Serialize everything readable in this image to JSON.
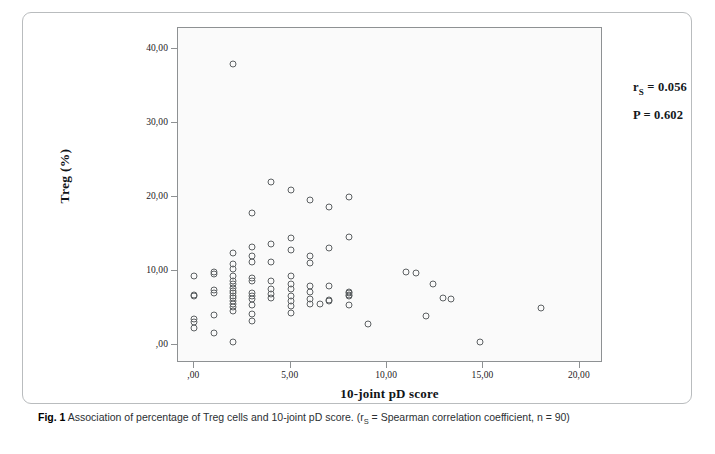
{
  "figure": {
    "caption_bold": "Fig. 1",
    "caption_text": " Association of percentage of Treg cells and 10-joint pD score. (r",
    "caption_sub": "S",
    "caption_tail": " = Spearman correlation coefficient, n = 90)"
  },
  "annotations": {
    "rs_prefix": "r",
    "rs_sub": "S",
    "rs_value": " = 0.056",
    "p_text": "P = 0.602"
  },
  "chart_data": {
    "type": "scatter",
    "title": "",
    "xlabel": "10-joint pD score",
    "ylabel": "Treg (%)",
    "xlim": [
      -0.85,
      21.2
    ],
    "ylim": [
      -2.4,
      42.8
    ],
    "xticks": [
      0,
      5,
      10,
      15,
      20
    ],
    "xticklabels": [
      ",00",
      "5,00",
      "10,00",
      "15,00",
      "20,00"
    ],
    "yticks": [
      0,
      10,
      20,
      30,
      40
    ],
    "yticklabels": [
      ",00",
      "10,00",
      "20,00",
      "30,00",
      "40,00"
    ],
    "grid": false,
    "legend": null,
    "marker": "open-circle",
    "marker_color": "#5d6163",
    "n_points": 90,
    "stats": {
      "spearman_rs": 0.056,
      "p_value": 0.602,
      "n": 90
    },
    "points": [
      [
        0.0,
        9.3
      ],
      [
        0.0,
        6.8
      ],
      [
        0.0,
        6.6
      ],
      [
        0.0,
        3.6
      ],
      [
        0.0,
        3.1
      ],
      [
        0.0,
        2.3
      ],
      [
        1.0,
        9.9
      ],
      [
        1.0,
        9.6
      ],
      [
        1.0,
        7.4
      ],
      [
        1.0,
        7.0
      ],
      [
        1.0,
        4.1
      ],
      [
        1.0,
        1.6
      ],
      [
        2.0,
        38.0
      ],
      [
        2.0,
        12.4
      ],
      [
        2.0,
        11.0
      ],
      [
        2.0,
        10.3
      ],
      [
        2.0,
        9.4
      ],
      [
        2.0,
        8.6
      ],
      [
        2.0,
        8.2
      ],
      [
        2.0,
        7.7
      ],
      [
        2.0,
        7.3
      ],
      [
        2.0,
        7.0
      ],
      [
        2.0,
        6.7
      ],
      [
        2.0,
        6.4
      ],
      [
        2.0,
        6.0
      ],
      [
        2.0,
        5.6
      ],
      [
        2.0,
        5.2
      ],
      [
        2.0,
        4.6
      ],
      [
        2.0,
        0.4
      ],
      [
        3.0,
        17.8
      ],
      [
        3.0,
        13.2
      ],
      [
        3.0,
        12.0
      ],
      [
        3.0,
        11.2
      ],
      [
        3.0,
        9.1
      ],
      [
        3.0,
        8.6
      ],
      [
        3.0,
        7.0
      ],
      [
        3.0,
        6.6
      ],
      [
        3.0,
        6.2
      ],
      [
        3.0,
        5.4
      ],
      [
        3.0,
        4.2
      ],
      [
        3.0,
        3.2
      ],
      [
        4.0,
        22.0
      ],
      [
        4.0,
        13.6
      ],
      [
        4.0,
        11.2
      ],
      [
        4.0,
        8.6
      ],
      [
        4.0,
        7.6
      ],
      [
        4.0,
        6.9
      ],
      [
        4.0,
        6.4
      ],
      [
        5.0,
        21.0
      ],
      [
        5.0,
        14.4
      ],
      [
        5.0,
        12.9
      ],
      [
        5.0,
        9.3
      ],
      [
        5.0,
        8.3
      ],
      [
        5.0,
        7.6
      ],
      [
        5.0,
        6.6
      ],
      [
        5.0,
        5.9
      ],
      [
        5.0,
        5.3
      ],
      [
        5.0,
        4.4
      ],
      [
        6.0,
        19.6
      ],
      [
        6.0,
        12.0
      ],
      [
        6.0,
        11.1
      ],
      [
        6.0,
        8.0
      ],
      [
        6.0,
        7.2
      ],
      [
        6.0,
        6.3
      ],
      [
        6.0,
        5.6
      ],
      [
        6.5,
        5.5
      ],
      [
        7.0,
        18.6
      ],
      [
        7.0,
        13.1
      ],
      [
        7.0,
        8.0
      ],
      [
        7.0,
        6.1
      ],
      [
        7.0,
        5.9
      ],
      [
        8.0,
        20.0
      ],
      [
        8.0,
        14.6
      ],
      [
        8.0,
        7.2
      ],
      [
        8.0,
        7.0
      ],
      [
        8.0,
        6.8
      ],
      [
        8.0,
        6.6
      ],
      [
        8.0,
        5.4
      ],
      [
        9.0,
        2.9
      ],
      [
        11.0,
        9.9
      ],
      [
        11.5,
        9.8
      ],
      [
        12.4,
        8.3
      ],
      [
        12.0,
        4.0
      ],
      [
        12.9,
        6.4
      ],
      [
        13.3,
        6.3
      ],
      [
        14.8,
        0.4
      ],
      [
        18.0,
        5.0
      ]
    ]
  }
}
